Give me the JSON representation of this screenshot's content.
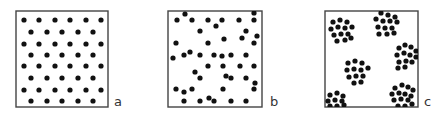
{
  "figure": {
    "colors": {
      "dot": "#111111",
      "frame": "#444444",
      "background": "#ffffff"
    },
    "dot_radius": 2.6,
    "panels": [
      {
        "id": "a",
        "label": "a",
        "pattern": "uniform",
        "box": {
          "x": 16,
          "y": 11,
          "w": 92,
          "h": 96
        },
        "label_pos": {
          "x": 114,
          "y": 95
        },
        "dots": [
          [
            24,
            20
          ],
          [
            39,
            20
          ],
          [
            55,
            20
          ],
          [
            70,
            20
          ],
          [
            86,
            20
          ],
          [
            101,
            20
          ],
          [
            31,
            32
          ],
          [
            47,
            32
          ],
          [
            62,
            32
          ],
          [
            78,
            32
          ],
          [
            93,
            32
          ],
          [
            24,
            44
          ],
          [
            39,
            44
          ],
          [
            55,
            44
          ],
          [
            70,
            44
          ],
          [
            86,
            44
          ],
          [
            101,
            44
          ],
          [
            31,
            55
          ],
          [
            47,
            55
          ],
          [
            62,
            55
          ],
          [
            78,
            55
          ],
          [
            93,
            55
          ],
          [
            24,
            66
          ],
          [
            39,
            66
          ],
          [
            55,
            66
          ],
          [
            70,
            66
          ],
          [
            86,
            66
          ],
          [
            101,
            66
          ],
          [
            31,
            78
          ],
          [
            47,
            78
          ],
          [
            62,
            78
          ],
          [
            78,
            78
          ],
          [
            93,
            78
          ],
          [
            24,
            90
          ],
          [
            39,
            90
          ],
          [
            55,
            90
          ],
          [
            70,
            90
          ],
          [
            86,
            90
          ],
          [
            101,
            90
          ],
          [
            31,
            101
          ],
          [
            47,
            101
          ],
          [
            62,
            101
          ],
          [
            78,
            101
          ],
          [
            93,
            101
          ]
        ]
      },
      {
        "id": "b",
        "label": "b",
        "pattern": "random",
        "box": {
          "x": 168,
          "y": 11,
          "w": 94,
          "h": 96
        },
        "label_pos": {
          "x": 270,
          "y": 95
        },
        "dots": [
          [
            185,
            14
          ],
          [
            254,
            13
          ],
          [
            177,
            20
          ],
          [
            192,
            20
          ],
          [
            208,
            20
          ],
          [
            222,
            20
          ],
          [
            239,
            20
          ],
          [
            254,
            20
          ],
          [
            216,
            26
          ],
          [
            200,
            31
          ],
          [
            246,
            31
          ],
          [
            257,
            36
          ],
          [
            224,
            39
          ],
          [
            242,
            38
          ],
          [
            176,
            43
          ],
          [
            208,
            43
          ],
          [
            254,
            43
          ],
          [
            173,
            58
          ],
          [
            184,
            55
          ],
          [
            190,
            52
          ],
          [
            200,
            55
          ],
          [
            214,
            55
          ],
          [
            222,
            56
          ],
          [
            231,
            55
          ],
          [
            246,
            55
          ],
          [
            208,
            66
          ],
          [
            223,
            66
          ],
          [
            240,
            66
          ],
          [
            254,
            66
          ],
          [
            195,
            72
          ],
          [
            200,
            78
          ],
          [
            226,
            76
          ],
          [
            231,
            78
          ],
          [
            246,
            78
          ],
          [
            255,
            83
          ],
          [
            176,
            89
          ],
          [
            184,
            92
          ],
          [
            192,
            89
          ],
          [
            223,
            89
          ],
          [
            254,
            89
          ],
          [
            184,
            101
          ],
          [
            200,
            101
          ],
          [
            209,
            98
          ],
          [
            214,
            101
          ],
          [
            231,
            101
          ],
          [
            246,
            101
          ]
        ]
      },
      {
        "id": "c",
        "label": "c",
        "pattern": "clustered",
        "box": {
          "x": 325,
          "y": 11,
          "w": 93,
          "h": 96
        },
        "label_pos": {
          "x": 424,
          "y": 95
        },
        "dots": [
          [
            333,
            22
          ],
          [
            340,
            20
          ],
          [
            347,
            22
          ],
          [
            331,
            29
          ],
          [
            338,
            27
          ],
          [
            345,
            28
          ],
          [
            352,
            27
          ],
          [
            334,
            35
          ],
          [
            341,
            34
          ],
          [
            348,
            34
          ],
          [
            337,
            41
          ],
          [
            345,
            40
          ],
          [
            351,
            38
          ],
          [
            381,
            13
          ],
          [
            388,
            15
          ],
          [
            395,
            17
          ],
          [
            376,
            19
          ],
          [
            383,
            21
          ],
          [
            390,
            21
          ],
          [
            397,
            22
          ],
          [
            378,
            27
          ],
          [
            385,
            28
          ],
          [
            392,
            28
          ],
          [
            379,
            34
          ],
          [
            387,
            34
          ],
          [
            394,
            33
          ],
          [
            399,
            48
          ],
          [
            405,
            45
          ],
          [
            411,
            47
          ],
          [
            416,
            51
          ],
          [
            397,
            55
          ],
          [
            404,
            53
          ],
          [
            410,
            55
          ],
          [
            416,
            57
          ],
          [
            399,
            62
          ],
          [
            406,
            61
          ],
          [
            412,
            62
          ],
          [
            405,
            67
          ],
          [
            398,
            68
          ],
          [
            348,
            63
          ],
          [
            355,
            61
          ],
          [
            362,
            63
          ],
          [
            347,
            70
          ],
          [
            354,
            69
          ],
          [
            361,
            70
          ],
          [
            368,
            68
          ],
          [
            349,
            77
          ],
          [
            356,
            76
          ],
          [
            363,
            76
          ],
          [
            354,
            83
          ],
          [
            361,
            82
          ],
          [
            330,
            95
          ],
          [
            337,
            93
          ],
          [
            343,
            96
          ],
          [
            328,
            101
          ],
          [
            335,
            100
          ],
          [
            342,
            101
          ],
          [
            330,
            106
          ],
          [
            337,
            106
          ],
          [
            344,
            105
          ],
          [
            395,
            88
          ],
          [
            402,
            85
          ],
          [
            408,
            87
          ],
          [
            413,
            90
          ],
          [
            392,
            94
          ],
          [
            399,
            93
          ],
          [
            405,
            94
          ],
          [
            411,
            96
          ],
          [
            394,
            100
          ],
          [
            401,
            99
          ],
          [
            408,
            100
          ],
          [
            398,
            106
          ],
          [
            405,
            106
          ],
          [
            412,
            104
          ]
        ]
      }
    ]
  }
}
